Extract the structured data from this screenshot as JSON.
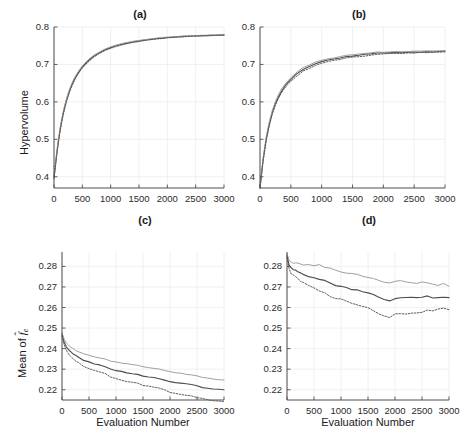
{
  "figure": {
    "panels": [
      {
        "id": "a",
        "title": "(a)"
      },
      {
        "id": "b",
        "title": "(b)"
      },
      {
        "id": "c",
        "title": "(c)"
      },
      {
        "id": "d",
        "title": "(d)"
      }
    ],
    "labels": {
      "hypervolume": "Hypervolume",
      "evaluation_number": "Evaluation Number",
      "mean_of": "Mean of ",
      "f_symbol": "f",
      "f_hat": "̂",
      "f_sub": "e"
    }
  },
  "chart_data": [
    {
      "type": "line",
      "id": "a",
      "title": "(a)",
      "xlabel": "",
      "ylabel": "Hypervolume",
      "xlim": [
        0,
        3000
      ],
      "ylim": [
        0.37,
        0.8
      ],
      "grid": true,
      "xticks": [
        0,
        500,
        1000,
        1500,
        2000,
        2500,
        3000
      ],
      "xticklabels": [
        "0",
        "500",
        "1000",
        "1500",
        "2000",
        "2500",
        "3000"
      ],
      "yticks": [
        0.4,
        0.5,
        0.6,
        0.7,
        0.8
      ],
      "yticklabels": [
        "0.4",
        "0.5",
        "0.6",
        "0.7",
        "0.8"
      ],
      "x": [
        0,
        50,
        100,
        150,
        200,
        250,
        300,
        350,
        400,
        450,
        500,
        600,
        700,
        800,
        900,
        1000,
        1100,
        1200,
        1300,
        1400,
        1500,
        1600,
        1700,
        1800,
        1900,
        2000,
        2100,
        2200,
        2300,
        2400,
        2500,
        2600,
        2700,
        2800,
        2900,
        3000
      ],
      "series": [
        {
          "name": "median",
          "style": "solid",
          "color": "#4d4d4d",
          "values": [
            0.398,
            0.463,
            0.518,
            0.56,
            0.593,
            0.619,
            0.64,
            0.657,
            0.671,
            0.683,
            0.693,
            0.709,
            0.722,
            0.731,
            0.739,
            0.745,
            0.75,
            0.754,
            0.757,
            0.76,
            0.763,
            0.765,
            0.767,
            0.769,
            0.77,
            0.772,
            0.773,
            0.774,
            0.775,
            0.776,
            0.776,
            0.777,
            0.777,
            0.778,
            0.778,
            0.779
          ]
        },
        {
          "name": "upper",
          "style": "solid",
          "color": "#9a9a9a",
          "values": [
            0.402,
            0.468,
            0.523,
            0.565,
            0.597,
            0.623,
            0.644,
            0.661,
            0.674,
            0.686,
            0.696,
            0.712,
            0.724,
            0.733,
            0.741,
            0.747,
            0.752,
            0.756,
            0.759,
            0.762,
            0.764,
            0.766,
            0.768,
            0.77,
            0.772,
            0.773,
            0.774,
            0.775,
            0.776,
            0.777,
            0.777,
            0.778,
            0.778,
            0.779,
            0.779,
            0.78
          ]
        },
        {
          "name": "lower",
          "style": "dotted",
          "color": "#555555",
          "values": [
            0.394,
            0.459,
            0.514,
            0.556,
            0.589,
            0.615,
            0.636,
            0.653,
            0.668,
            0.68,
            0.69,
            0.706,
            0.719,
            0.729,
            0.737,
            0.743,
            0.748,
            0.752,
            0.756,
            0.759,
            0.761,
            0.764,
            0.766,
            0.768,
            0.769,
            0.771,
            0.772,
            0.773,
            0.774,
            0.775,
            0.776,
            0.776,
            0.777,
            0.777,
            0.778,
            0.778
          ]
        }
      ]
    },
    {
      "type": "line",
      "id": "b",
      "title": "(b)",
      "xlabel": "",
      "ylabel": "",
      "xlim": [
        0,
        3000
      ],
      "ylim": [
        0.37,
        0.8
      ],
      "grid": true,
      "xticks": [
        0,
        500,
        1000,
        1500,
        2000,
        2500,
        3000
      ],
      "xticklabels": [
        "0",
        "500",
        "1000",
        "1500",
        "2000",
        "2500",
        "3000"
      ],
      "yticks": [
        0.4,
        0.5,
        0.6,
        0.7,
        0.8
      ],
      "yticklabels": [
        "0.4",
        "0.5",
        "0.6",
        "0.7",
        "0.8"
      ],
      "x": [
        0,
        50,
        100,
        150,
        200,
        250,
        300,
        350,
        400,
        450,
        500,
        600,
        700,
        800,
        900,
        1000,
        1100,
        1200,
        1300,
        1400,
        1500,
        1600,
        1700,
        1800,
        1900,
        2000,
        2100,
        2200,
        2300,
        2400,
        2500,
        2600,
        2700,
        2800,
        2900,
        3000
      ],
      "series": [
        {
          "name": "median",
          "style": "solid",
          "color": "#4d4d4d",
          "values": [
            0.372,
            0.445,
            0.5,
            0.54,
            0.572,
            0.596,
            0.614,
            0.629,
            0.641,
            0.651,
            0.66,
            0.675,
            0.686,
            0.695,
            0.702,
            0.707,
            0.712,
            0.715,
            0.718,
            0.721,
            0.723,
            0.725,
            0.727,
            0.729,
            0.73,
            0.731,
            0.731,
            0.732,
            0.732,
            0.733,
            0.733,
            0.733,
            0.734,
            0.734,
            0.734,
            0.735
          ]
        },
        {
          "name": "upper",
          "style": "solid",
          "color": "#9a9a9a",
          "values": [
            0.376,
            0.45,
            0.506,
            0.546,
            0.578,
            0.601,
            0.62,
            0.634,
            0.646,
            0.656,
            0.665,
            0.68,
            0.691,
            0.699,
            0.706,
            0.711,
            0.715,
            0.718,
            0.721,
            0.724,
            0.726,
            0.728,
            0.73,
            0.732,
            0.733,
            0.733,
            0.734,
            0.734,
            0.734,
            0.735,
            0.735,
            0.735,
            0.736,
            0.736,
            0.736,
            0.736
          ]
        },
        {
          "name": "lower",
          "style": "dotted",
          "color": "#555555",
          "values": [
            0.368,
            0.441,
            0.496,
            0.536,
            0.567,
            0.591,
            0.609,
            0.624,
            0.636,
            0.646,
            0.655,
            0.67,
            0.682,
            0.69,
            0.697,
            0.703,
            0.707,
            0.711,
            0.714,
            0.717,
            0.719,
            0.721,
            0.723,
            0.725,
            0.727,
            0.728,
            0.729,
            0.73,
            0.73,
            0.731,
            0.731,
            0.732,
            0.732,
            0.733,
            0.733,
            0.733
          ]
        }
      ]
    },
    {
      "type": "line",
      "id": "c",
      "title": "(c)",
      "xlabel": "Evaluation Number",
      "ylabel": "Mean of f̂e",
      "xlim": [
        0,
        3000
      ],
      "ylim": [
        0.215,
        0.287
      ],
      "grid": true,
      "xticks": [
        0,
        500,
        1000,
        1500,
        2000,
        2500,
        3000
      ],
      "xticklabels": [
        "0",
        "500",
        "1000",
        "1500",
        "2000",
        "2500",
        "3000"
      ],
      "yticks": [
        0.22,
        0.23,
        0.24,
        0.25,
        0.26,
        0.27,
        0.28
      ],
      "yticklabels": [
        "0.22",
        "0.23",
        "0.24",
        "0.25",
        "0.26",
        "0.27",
        "0.28"
      ],
      "x": [
        0,
        40,
        80,
        120,
        160,
        200,
        250,
        300,
        400,
        500,
        600,
        700,
        800,
        900,
        1000,
        1100,
        1200,
        1300,
        1400,
        1500,
        1600,
        1700,
        1800,
        1900,
        2000,
        2100,
        2200,
        2300,
        2400,
        2500,
        2600,
        2700,
        2800,
        2900,
        3000
      ],
      "series": [
        {
          "name": "median",
          "style": "solid",
          "color": "#4d4d4d",
          "values": [
            0.247,
            0.2432,
            0.241,
            0.2396,
            0.2385,
            0.2376,
            0.2366,
            0.2358,
            0.2344,
            0.2334,
            0.2327,
            0.232,
            0.2313,
            0.23,
            0.2294,
            0.2288,
            0.2283,
            0.2278,
            0.2274,
            0.2266,
            0.2262,
            0.2259,
            0.2255,
            0.2248,
            0.224,
            0.2236,
            0.2232,
            0.2228,
            0.2224,
            0.2218,
            0.2212,
            0.2208,
            0.2205,
            0.2202,
            0.22
          ]
        },
        {
          "name": "upper",
          "style": "solid",
          "color": "#9a9a9a",
          "values": [
            0.2478,
            0.2446,
            0.2428,
            0.2416,
            0.2407,
            0.24,
            0.2392,
            0.2385,
            0.2374,
            0.2366,
            0.236,
            0.2354,
            0.2348,
            0.234,
            0.2335,
            0.233,
            0.2326,
            0.2322,
            0.2318,
            0.2311,
            0.2307,
            0.2304,
            0.23,
            0.2294,
            0.2288,
            0.2284,
            0.228,
            0.2276,
            0.2272,
            0.2266,
            0.226,
            0.2256,
            0.2252,
            0.2249,
            0.2247
          ]
        },
        {
          "name": "lower",
          "style": "dotted",
          "color": "#555555",
          "values": [
            0.2462,
            0.2418,
            0.2392,
            0.2376,
            0.2363,
            0.2353,
            0.2341,
            0.2332,
            0.2315,
            0.2303,
            0.2294,
            0.2286,
            0.2278,
            0.2262,
            0.2254,
            0.2247,
            0.2241,
            0.2236,
            0.2231,
            0.2222,
            0.2217,
            0.2213,
            0.2208,
            0.2198,
            0.2188,
            0.2183,
            0.2178,
            0.2174,
            0.217,
            0.2163,
            0.2157,
            0.2152,
            0.2148,
            0.2145,
            0.2142
          ]
        }
      ]
    },
    {
      "type": "line",
      "id": "d",
      "title": "(d)",
      "xlabel": "Evaluation Number",
      "ylabel": "",
      "xlim": [
        0,
        3000
      ],
      "ylim": [
        0.215,
        0.287
      ],
      "grid": true,
      "xticks": [
        0,
        500,
        1000,
        1500,
        2000,
        2500,
        3000
      ],
      "xticklabels": [
        "0",
        "500",
        "1000",
        "1500",
        "2000",
        "2500",
        "3000"
      ],
      "yticks": [
        0.22,
        0.23,
        0.24,
        0.25,
        0.26,
        0.27,
        0.28
      ],
      "yticklabels": [
        "0.22",
        "0.23",
        "0.24",
        "0.25",
        "0.26",
        "0.27",
        "0.28"
      ],
      "x": [
        0,
        40,
        80,
        120,
        160,
        200,
        250,
        300,
        400,
        500,
        600,
        700,
        800,
        900,
        1000,
        1100,
        1200,
        1300,
        1400,
        1500,
        1600,
        1700,
        1800,
        1900,
        2000,
        2100,
        2200,
        2300,
        2400,
        2500,
        2600,
        2700,
        2800,
        2900,
        3000
      ],
      "series": [
        {
          "name": "median",
          "style": "solid",
          "color": "#4d4d4d",
          "values": [
            0.2852,
            0.2808,
            0.2792,
            0.2786,
            0.278,
            0.2775,
            0.2768,
            0.2762,
            0.275,
            0.2742,
            0.2736,
            0.2728,
            0.2718,
            0.271,
            0.2704,
            0.2697,
            0.269,
            0.2684,
            0.2676,
            0.2668,
            0.266,
            0.265,
            0.2638,
            0.2632,
            0.2642,
            0.2645,
            0.2648,
            0.2652,
            0.2648,
            0.265,
            0.2654,
            0.265,
            0.2646,
            0.265,
            0.2645
          ]
        },
        {
          "name": "upper",
          "style": "solid",
          "color": "#9a9a9a",
          "values": [
            0.2862,
            0.283,
            0.2818,
            0.2815,
            0.2818,
            0.2814,
            0.2808,
            0.2804,
            0.2808,
            0.2802,
            0.2806,
            0.2798,
            0.279,
            0.2782,
            0.2776,
            0.277,
            0.2764,
            0.2758,
            0.2752,
            0.2744,
            0.2738,
            0.273,
            0.2722,
            0.2718,
            0.2726,
            0.273,
            0.2726,
            0.272,
            0.2716,
            0.2724,
            0.2718,
            0.2712,
            0.2708,
            0.2714,
            0.27
          ]
        },
        {
          "name": "lower",
          "style": "dotted",
          "color": "#555555",
          "values": [
            0.2842,
            0.2786,
            0.2766,
            0.2758,
            0.2748,
            0.274,
            0.273,
            0.2722,
            0.2706,
            0.2692,
            0.2682,
            0.267,
            0.2656,
            0.2646,
            0.264,
            0.2632,
            0.2624,
            0.2616,
            0.2606,
            0.2596,
            0.2586,
            0.2572,
            0.2558,
            0.2552,
            0.2568,
            0.2572,
            0.2568,
            0.2574,
            0.257,
            0.2576,
            0.2586,
            0.258,
            0.259,
            0.2596,
            0.2588
          ]
        }
      ]
    }
  ]
}
